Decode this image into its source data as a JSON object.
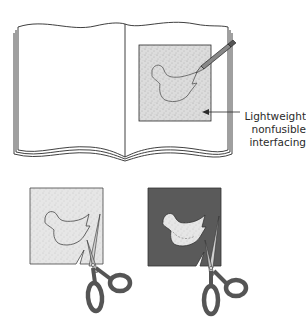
{
  "figure": {
    "callout": {
      "lines": [
        "Lightweight",
        "nonfusible",
        "interfacing"
      ]
    },
    "elements": {
      "book": "open-book",
      "interfacing_square": "stippled-interfacing-on-book",
      "pencil": "pencil-tracing",
      "bird_outline": "traced-bird-shape",
      "cut_step_1": "stippled-square-with-bird-outline-and-scissors",
      "cut_step_2": "dark-square-with-cut-bird-and-scissors"
    },
    "colors": {
      "line": "#2a2a2a",
      "interfacing": "#d9d9d9",
      "dark_fabric": "#5a5a5a",
      "scissor_handle": "#6b6b6b",
      "blade": "#cfcfcf"
    }
  }
}
